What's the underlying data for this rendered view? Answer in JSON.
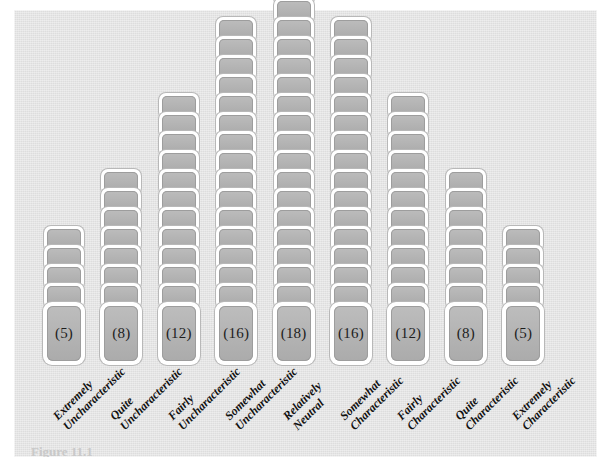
{
  "figure": {
    "type": "q-sort-distribution",
    "panel_background": "#e3e3e3",
    "card_fill": "#b3b3b3",
    "card_border": "#ffffff",
    "caption": "Figure 11.1"
  },
  "chart_data": {
    "type": "bar",
    "title": "",
    "subtitle": "",
    "xlabel": "",
    "ylabel": "",
    "grid": false,
    "legend": "none",
    "orientation": "vertical",
    "note": "Forced-choice quasi-normal Q-sort distribution; each stacked card represents one item slot. Value in parentheses on the bottom card of each column is the number of cards in that column.",
    "ylim": [
      0,
      18
    ],
    "categories": [
      "Extremely Uncharacteristic",
      "Quite Uncharacteristic",
      "Fairly Uncharacteristic",
      "Somewhat Uncharacteristic",
      "Relatively Neutral",
      "Somewhat Characteristic",
      "Fairly Characteristic",
      "Quite Characteristic",
      "Extremely Characteristic"
    ],
    "values": [
      5,
      8,
      12,
      16,
      18,
      16,
      12,
      8,
      5
    ],
    "total": 100
  },
  "columns": [
    {
      "id": "col-1",
      "count": 5,
      "count_label": "(5)",
      "label_line1": "Extremely",
      "label_line2": "Uncharacteristic"
    },
    {
      "id": "col-2",
      "count": 8,
      "count_label": "(8)",
      "label_line1": "Quite",
      "label_line2": "Uncharacteristic"
    },
    {
      "id": "col-3",
      "count": 12,
      "count_label": "(12)",
      "label_line1": "Fairly",
      "label_line2": "Uncharacteristic"
    },
    {
      "id": "col-4",
      "count": 16,
      "count_label": "(16)",
      "label_line1": "Somewhat",
      "label_line2": "Uncharacteristic"
    },
    {
      "id": "col-5",
      "count": 18,
      "count_label": "(18)",
      "label_line1": "Relatively",
      "label_line2": "Neutral"
    },
    {
      "id": "col-6",
      "count": 16,
      "count_label": "(16)",
      "label_line1": "Somewhat",
      "label_line2": "Characteristic"
    },
    {
      "id": "col-7",
      "count": 12,
      "count_label": "(12)",
      "label_line1": "Fairly",
      "label_line2": "Characteristic"
    },
    {
      "id": "col-8",
      "count": 8,
      "count_label": "(8)",
      "label_line1": "Quite",
      "label_line2": "Characteristic"
    },
    {
      "id": "col-9",
      "count": 5,
      "count_label": "(5)",
      "label_line1": "Extremely",
      "label_line2": "Characteristic"
    }
  ]
}
